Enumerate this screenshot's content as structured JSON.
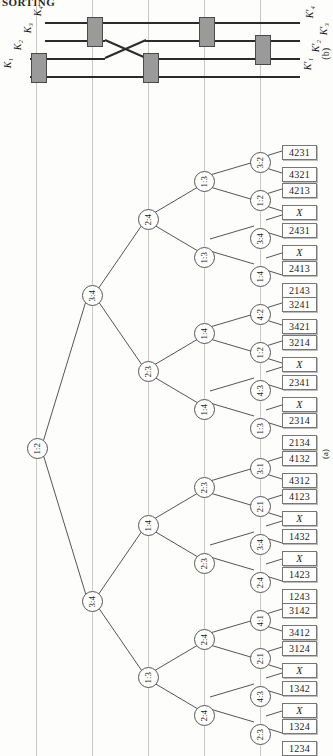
{
  "running_header": "SORTING",
  "figure_b": {
    "caption": "(b)",
    "input_labels": [
      "K₁",
      "K₂",
      "K₃",
      "K₄"
    ],
    "output_labels": [
      "K′₁",
      "K′₂",
      "K′₃",
      "K′₄"
    ],
    "wire_count": 4,
    "comparators": [
      {
        "stage": 1,
        "wires": [
          1,
          2
        ]
      },
      {
        "stage": 2,
        "wires": [
          3,
          4
        ]
      },
      {
        "stage": 3,
        "wires": [
          1,
          2
        ]
      },
      {
        "stage": 4,
        "wires": [
          3,
          4
        ]
      },
      {
        "stage": 5,
        "wires": [
          2,
          3
        ]
      }
    ],
    "crossover": true
  },
  "figure_a": {
    "caption": "(a)",
    "root": "1:2",
    "level_labels": {
      "depth1": [
        "3:4",
        "3:4"
      ],
      "depth2": [
        "2:4",
        "2:3",
        "1:4",
        "1:3"
      ],
      "depth3": [
        "1:3",
        "1:3",
        "1:4",
        "1:4",
        "2:3",
        "2:3",
        "2:4",
        "2:4"
      ],
      "depth4": [
        "3:2",
        "1:2",
        "3:4",
        "1:4",
        "4:2",
        "1:2",
        "4:3",
        "1:3",
        "3:1",
        "2:1",
        "3:4",
        "2:4",
        "4:1",
        "2:1",
        "4:3",
        "2:3"
      ]
    },
    "leaves": [
      "4231",
      "4321",
      "4213",
      "X",
      "2431",
      "X",
      "2413",
      "2143",
      "3241",
      "3421",
      "3214",
      "X",
      "2341",
      "X",
      "2314",
      "2134",
      "4132",
      "4312",
      "4123",
      "X",
      "1432",
      "X",
      "1423",
      "1243",
      "3142",
      "3412",
      "3124",
      "X",
      "1342",
      "X",
      "1324",
      "1234"
    ]
  },
  "colors": {
    "ink": "#1a1a1a",
    "rule": "#c9c9c9",
    "comparator_fill": "#9a9a9a",
    "leaf_border": "#777777"
  }
}
